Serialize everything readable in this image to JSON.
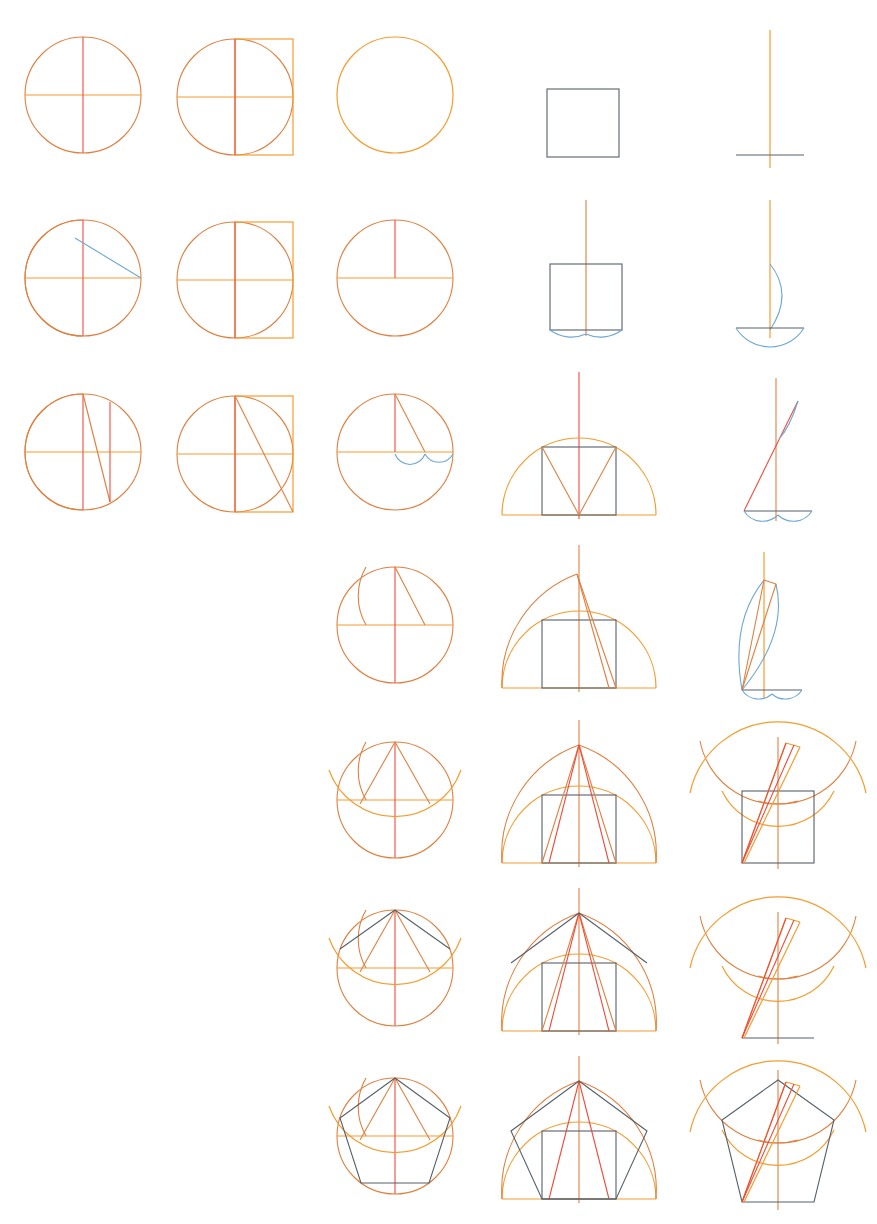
{
  "document": {
    "title": "Regular pentagon straightedge-and-compass construction sequence",
    "kind": "geometric-construction-sheet",
    "background_color": "#ffffff",
    "width": 877,
    "height": 1224
  },
  "palette": {
    "orange": "#e08040",
    "orange_bright": "#f59c2e",
    "red": "#ee4b3c",
    "blue": "#6da8d6",
    "slate": "#55606b"
  },
  "grid": {
    "columns": 5,
    "rows": 7,
    "column_centers": [
      83,
      235,
      395,
      578,
      770
    ],
    "row_centers": [
      95,
      278,
      452,
      625,
      800,
      968,
      1140
    ],
    "cell_radius": 58
  },
  "legend": {
    "orange": "construction circles and arcs",
    "red": "chords and radii of the active step",
    "blue": "compass arcs marking intersections",
    "slate": "final polygon edges and inscribed square"
  },
  "cells": [
    {
      "row": 1,
      "col": 1,
      "name": "circle-with-axes",
      "caption": "Circle with horizontal diameter and vertical radius"
    },
    {
      "row": 1,
      "col": 2,
      "name": "circle-with-square",
      "caption": "Circle with circumscribing right square"
    },
    {
      "row": 1,
      "col": 3,
      "name": "plain-circle",
      "caption": "Plain circle"
    },
    {
      "row": 1,
      "col": 4,
      "name": "plain-square",
      "caption": "Plain square"
    },
    {
      "row": 1,
      "col": 5,
      "name": "axis-cross",
      "caption": "Vertical axis crossing a horizontal baseline"
    },
    {
      "row": 2,
      "col": 1,
      "name": "circle-arc-chord",
      "caption": "Arc struck from the right vertex, blue chord to centre"
    },
    {
      "row": 2,
      "col": 2,
      "name": "circle-square-axes",
      "caption": "Circle, square and full axes"
    },
    {
      "row": 2,
      "col": 3,
      "name": "circle-half-axis",
      "caption": "Circle, diameter and upper radius"
    },
    {
      "row": 2,
      "col": 4,
      "name": "square-axis-arcs",
      "caption": "Square with central axis and two blue base arcs"
    },
    {
      "row": 2,
      "col": 5,
      "name": "axis-arc-lens",
      "caption": "Axis with blue arc and base arc"
    },
    {
      "row": 3,
      "col": 1,
      "name": "circle-arcs-verticals",
      "caption": "Arc plus vertical ordinate and oblique chord"
    },
    {
      "row": 3,
      "col": 2,
      "name": "circle-square-diagonal",
      "caption": "Circle, square and diagonal chord"
    },
    {
      "row": 3,
      "col": 3,
      "name": "circle-chord-arcs",
      "caption": "Chord from top with blue arcs on the diameter"
    },
    {
      "row": 3,
      "col": 4,
      "name": "semicircle-square-vee",
      "caption": "Semicircle, inscribed square and V chords"
    },
    {
      "row": 3,
      "col": 5,
      "name": "axis-oblique-arcs",
      "caption": "Oblique line with blue arcs"
    },
    {
      "row": 4,
      "col": 3,
      "name": "circle-arc-chord-2",
      "caption": "Circle with arc and chord from the apex"
    },
    {
      "row": 4,
      "col": 4,
      "name": "semicircle-arc-chord",
      "caption": "Semicircle, square and large outer arc"
    },
    {
      "row": 4,
      "col": 5,
      "name": "lens-arcs",
      "caption": "Lens of arcs with chords"
    },
    {
      "row": 5,
      "col": 3,
      "name": "circle-two-chords",
      "caption": "Circle with two apex chords and crossing arcs"
    },
    {
      "row": 5,
      "col": 4,
      "name": "semicircle-two-chords",
      "caption": "Semicircle with apex chords and square"
    },
    {
      "row": 5,
      "col": 5,
      "name": "arcs-crossing",
      "caption": "Crossing arcs with sliver and square"
    },
    {
      "row": 6,
      "col": 3,
      "name": "circle-polygon-start",
      "caption": "Circle with first polygon edges"
    },
    {
      "row": 6,
      "col": 4,
      "name": "semicircle-polygon-start",
      "caption": "Semicircle with polygon edges"
    },
    {
      "row": 6,
      "col": 5,
      "name": "arcs-polygon-start",
      "caption": "Crossing arcs with partial polygon"
    },
    {
      "row": 7,
      "col": 3,
      "name": "circle-pentagon",
      "caption": "Completed pentagon inscribed in circle"
    },
    {
      "row": 7,
      "col": 4,
      "name": "semicircle-pentagon",
      "caption": "Completed pentagon on semicircle"
    },
    {
      "row": 7,
      "col": 5,
      "name": "arcs-pentagon",
      "caption": "Completed pentagon with construction arcs"
    }
  ]
}
